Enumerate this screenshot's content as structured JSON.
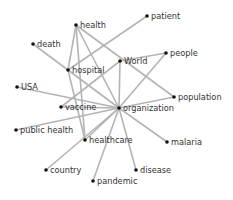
{
  "graph": {
    "title": "",
    "edge_color": "#b4b4b4",
    "node_color": "#111111",
    "label_color": "#333333",
    "nodes": [
      {
        "id": "health",
        "label": "health",
        "x": 76,
        "y": 25
      },
      {
        "id": "patient",
        "label": "patient",
        "x": 147,
        "y": 16
      },
      {
        "id": "death",
        "label": "death",
        "x": 33,
        "y": 44
      },
      {
        "id": "World",
        "label": "World",
        "x": 120,
        "y": 61
      },
      {
        "id": "people",
        "label": "people",
        "x": 166,
        "y": 53
      },
      {
        "id": "hospital",
        "label": "hospital",
        "x": 68,
        "y": 70
      },
      {
        "id": "USA",
        "label": "USA",
        "x": 17,
        "y": 87
      },
      {
        "id": "population",
        "label": "population",
        "x": 174,
        "y": 97
      },
      {
        "id": "vaccine",
        "label": "vaccine",
        "x": 61,
        "y": 107
      },
      {
        "id": "organization",
        "label": "organization",
        "x": 119,
        "y": 108
      },
      {
        "id": "public health",
        "label": "public health",
        "x": 16,
        "y": 130
      },
      {
        "id": "healthcare",
        "label": "healthcare",
        "x": 85,
        "y": 140
      },
      {
        "id": "malaria",
        "label": "malaria",
        "x": 167,
        "y": 142
      },
      {
        "id": "country",
        "label": "country",
        "x": 46,
        "y": 170
      },
      {
        "id": "disease",
        "label": "disease",
        "x": 136,
        "y": 170
      },
      {
        "id": "pandemic",
        "label": "pandemic",
        "x": 93,
        "y": 181
      }
    ],
    "edges": [
      [
        "health",
        "hospital"
      ],
      [
        "health",
        "organization"
      ],
      [
        "health",
        "healthcare"
      ],
      [
        "health",
        "population"
      ],
      [
        "patient",
        "hospital"
      ],
      [
        "death",
        "hospital"
      ],
      [
        "hospital",
        "organization"
      ],
      [
        "hospital",
        "healthcare"
      ],
      [
        "World",
        "people"
      ],
      [
        "World",
        "vaccine"
      ],
      [
        "World",
        "organization"
      ],
      [
        "people",
        "organization"
      ],
      [
        "USA",
        "organization"
      ],
      [
        "vaccine",
        "organization"
      ],
      [
        "public health",
        "organization"
      ],
      [
        "healthcare",
        "organization"
      ],
      [
        "country",
        "organization"
      ],
      [
        "pandemic",
        "organization"
      ],
      [
        "disease",
        "organization"
      ],
      [
        "malaria",
        "organization"
      ],
      [
        "population",
        "organization"
      ]
    ]
  }
}
